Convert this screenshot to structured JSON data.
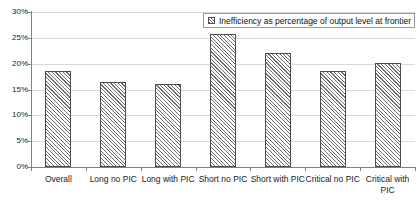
{
  "chart_data": {
    "type": "bar",
    "title": "",
    "subtitle": "",
    "xlabel": "",
    "ylabel": "",
    "categories": [
      "Overall",
      "Long no PIC",
      "Long with PIC",
      "Short no PIC",
      "Short with PIC",
      "Critical no PIC",
      "Critical with PIC"
    ],
    "values": [
      18.5,
      16.5,
      16.1,
      25.7,
      22.0,
      18.5,
      20.2
    ],
    "series": [
      {
        "name": "Inefficiency as percentage of output level at frontier",
        "values": [
          18.5,
          16.5,
          16.1,
          25.7,
          22.0,
          18.5,
          20.2
        ]
      }
    ],
    "ylim": [
      0,
      30
    ],
    "ytick_values": [
      0,
      5,
      10,
      15,
      20,
      25,
      30
    ],
    "ytick_labels": [
      "0%",
      "5%",
      "10%",
      "15%",
      "20%",
      "25%",
      "30%"
    ],
    "grid": true,
    "grid_axis": "y",
    "legend_position": "top-right",
    "legend_entries": [
      "Inefficiency as percentage of output level at frontier"
    ],
    "annotations": []
  },
  "legend": {
    "label": "Inefficiency as percentage of output level at frontier",
    "swatch_icon": "hatched-square-swatch"
  },
  "colors": {
    "bar_fill": "#ffffff",
    "bar_hatch": "#6e6e6e",
    "bar_border": "#4d4d4d",
    "gridline": "#d9d9d9",
    "axis": "#808080",
    "text": "#1a1a1a",
    "background": "#ffffff"
  }
}
